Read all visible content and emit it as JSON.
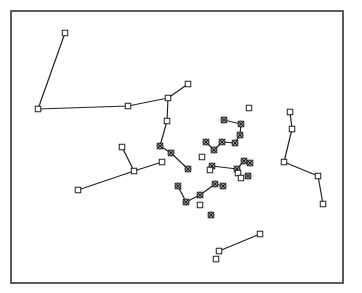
{
  "figure": {
    "type": "network-diagram",
    "frame": {
      "x": 11,
      "y": 11,
      "width": 332,
      "height": 272,
      "stroke": "#333333"
    },
    "colors": {
      "line": "#222222",
      "marker": "#222222",
      "background": "#ffffff"
    },
    "marker_types": {
      "square": "open-square-marker",
      "star": "asterisk-box-marker"
    }
  },
  "nodes": [
    {
      "id": "n1",
      "x": 65,
      "y": 33,
      "marker": "square"
    },
    {
      "id": "n2",
      "x": 38,
      "y": 109,
      "marker": "square"
    },
    {
      "id": "n3",
      "x": 128,
      "y": 106,
      "marker": "square"
    },
    {
      "id": "n4",
      "x": 168,
      "y": 98,
      "marker": "square"
    },
    {
      "id": "n5",
      "x": 188,
      "y": 84,
      "marker": "square"
    },
    {
      "id": "n6",
      "x": 167,
      "y": 121,
      "marker": "square"
    },
    {
      "id": "n7",
      "x": 160,
      "y": 146,
      "marker": "star"
    },
    {
      "id": "n8",
      "x": 171,
      "y": 153,
      "marker": "star"
    },
    {
      "id": "n9",
      "x": 188,
      "y": 169,
      "marker": "star"
    },
    {
      "id": "n10",
      "x": 122,
      "y": 147,
      "marker": "square"
    },
    {
      "id": "n11",
      "x": 134,
      "y": 171,
      "marker": "square"
    },
    {
      "id": "n12",
      "x": 78,
      "y": 190,
      "marker": "square"
    },
    {
      "id": "n13",
      "x": 162,
      "y": 162,
      "marker": "square"
    },
    {
      "id": "n14",
      "x": 249,
      "y": 108,
      "marker": "square"
    },
    {
      "id": "n15",
      "x": 224,
      "y": 120,
      "marker": "star"
    },
    {
      "id": "n16",
      "x": 241,
      "y": 124,
      "marker": "star"
    },
    {
      "id": "n17",
      "x": 240,
      "y": 135,
      "marker": "star"
    },
    {
      "id": "n18",
      "x": 235,
      "y": 143,
      "marker": "star"
    },
    {
      "id": "n19",
      "x": 222,
      "y": 142,
      "marker": "star"
    },
    {
      "id": "n20",
      "x": 214,
      "y": 150,
      "marker": "star"
    },
    {
      "id": "n21",
      "x": 206,
      "y": 142,
      "marker": "star"
    },
    {
      "id": "n22",
      "x": 202,
      "y": 157,
      "marker": "square"
    },
    {
      "id": "n23",
      "x": 212,
      "y": 166,
      "marker": "star"
    },
    {
      "id": "n24",
      "x": 237,
      "y": 169,
      "marker": "star"
    },
    {
      "id": "n25",
      "x": 244,
      "y": 161,
      "marker": "star"
    },
    {
      "id": "n26",
      "x": 250,
      "y": 163,
      "marker": "star"
    },
    {
      "id": "n27",
      "x": 238,
      "y": 173,
      "marker": "square"
    },
    {
      "id": "n28",
      "x": 241,
      "y": 178,
      "marker": "square"
    },
    {
      "id": "n29",
      "x": 248,
      "y": 176,
      "marker": "star"
    },
    {
      "id": "n30",
      "x": 210,
      "y": 170,
      "marker": "square"
    },
    {
      "id": "n31",
      "x": 178,
      "y": 186,
      "marker": "star"
    },
    {
      "id": "n32",
      "x": 186,
      "y": 202,
      "marker": "star"
    },
    {
      "id": "n33",
      "x": 200,
      "y": 195,
      "marker": "star"
    },
    {
      "id": "n34",
      "x": 215,
      "y": 184,
      "marker": "star"
    },
    {
      "id": "n35",
      "x": 223,
      "y": 186,
      "marker": "star"
    },
    {
      "id": "n36",
      "x": 200,
      "y": 205,
      "marker": "square"
    },
    {
      "id": "n37",
      "x": 211,
      "y": 215,
      "marker": "star"
    },
    {
      "id": "n38",
      "x": 290,
      "y": 112,
      "marker": "square"
    },
    {
      "id": "n39",
      "x": 292,
      "y": 129,
      "marker": "square"
    },
    {
      "id": "n40",
      "x": 284,
      "y": 162,
      "marker": "square"
    },
    {
      "id": "n41",
      "x": 318,
      "y": 176,
      "marker": "square"
    },
    {
      "id": "n42",
      "x": 323,
      "y": 204,
      "marker": "square"
    },
    {
      "id": "n43",
      "x": 260,
      "y": 234,
      "marker": "square"
    },
    {
      "id": "n44",
      "x": 219,
      "y": 251,
      "marker": "square"
    },
    {
      "id": "n45",
      "x": 216,
      "y": 259,
      "marker": "square"
    }
  ],
  "edges": [
    [
      "n1",
      "n2"
    ],
    [
      "n2",
      "n3"
    ],
    [
      "n3",
      "n4"
    ],
    [
      "n4",
      "n5"
    ],
    [
      "n4",
      "n6"
    ],
    [
      "n6",
      "n7"
    ],
    [
      "n7",
      "n8"
    ],
    [
      "n8",
      "n9"
    ],
    [
      "n10",
      "n11"
    ],
    [
      "n12",
      "n11"
    ],
    [
      "n11",
      "n13"
    ],
    [
      "n15",
      "n16"
    ],
    [
      "n16",
      "n17"
    ],
    [
      "n17",
      "n18"
    ],
    [
      "n18",
      "n19"
    ],
    [
      "n19",
      "n20"
    ],
    [
      "n20",
      "n21"
    ],
    [
      "n23",
      "n24"
    ],
    [
      "n24",
      "n25"
    ],
    [
      "n25",
      "n26"
    ],
    [
      "n24",
      "n27"
    ],
    [
      "n27",
      "n28"
    ],
    [
      "n31",
      "n32"
    ],
    [
      "n32",
      "n33"
    ],
    [
      "n33",
      "n34"
    ],
    [
      "n34",
      "n35"
    ],
    [
      "n38",
      "n39"
    ],
    [
      "n39",
      "n40"
    ],
    [
      "n40",
      "n41"
    ],
    [
      "n41",
      "n42"
    ],
    [
      "n43",
      "n44"
    ]
  ]
}
